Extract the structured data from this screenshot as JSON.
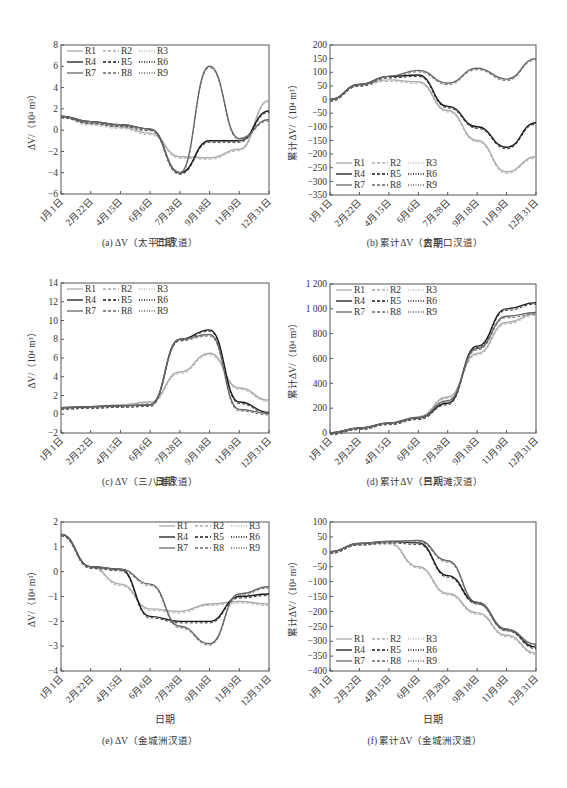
{
  "figure": {
    "x_axis_label": "日期",
    "x_tick_labels": [
      "1月1日",
      "2月22日",
      "4月15日",
      "6月6日",
      "7月28日",
      "9月18日",
      "11月9日",
      "12月31日"
    ],
    "legend": [
      "R1",
      "R2",
      "R3",
      "R4",
      "R5",
      "R6",
      "R7",
      "R8",
      "R9"
    ]
  },
  "chart_data": [
    {
      "id": "a",
      "type": "line",
      "caption": "(a) ΔV（太平口汊道）",
      "title": "",
      "xlabel": "日期",
      "ylabel": "ΔV/（10⁴ m³）",
      "x": [
        "1月1日",
        "2月22日",
        "4月15日",
        "6月6日",
        "7月28日",
        "9月18日",
        "11月9日",
        "12月31日"
      ],
      "ylim": [
        -6,
        8
      ],
      "yticks": [
        -6,
        -4,
        -2,
        0,
        2,
        4,
        6,
        8
      ],
      "grid": false,
      "legend_position": "upper left",
      "series": [
        {
          "name": "R1-R3 (gray)",
          "values": [
            1.3,
            0.6,
            0.3,
            -0.3,
            -2.5,
            -2.6,
            -1.8,
            2.8
          ]
        },
        {
          "name": "R4-R6 (black)",
          "values": [
            1.3,
            0.8,
            0.5,
            0.1,
            -4.0,
            -1.0,
            -1.0,
            1.8
          ]
        },
        {
          "name": "R7-R9 (dark gray)",
          "values": [
            1.3,
            0.8,
            0.5,
            0.1,
            -4.0,
            6.0,
            -0.8,
            1.0
          ]
        }
      ]
    },
    {
      "id": "b",
      "type": "line",
      "caption": "(b) 累计ΔV（太平口汊道）",
      "title": "",
      "xlabel": "日期",
      "ylabel": "累计ΔV/（10⁴ m³）",
      "x": [
        "1月1日",
        "2月22日",
        "4月15日",
        "6月6日",
        "7月28日",
        "9月18日",
        "11月9日",
        "12月31日"
      ],
      "ylim": [
        -350,
        200
      ],
      "yticks": [
        -350,
        -300,
        -250,
        -200,
        -150,
        -100,
        -50,
        0,
        50,
        100,
        150,
        200
      ],
      "grid": false,
      "legend_position": "lower left",
      "series": [
        {
          "name": "R1-R3 (gray)",
          "values": [
            0,
            55,
            72,
            65,
            -40,
            -150,
            -265,
            -210
          ]
        },
        {
          "name": "R4-R6 (black)",
          "values": [
            0,
            55,
            85,
            90,
            -25,
            -100,
            -175,
            -85
          ]
        },
        {
          "name": "R7-R9 (dark gray)",
          "values": [
            0,
            55,
            85,
            107,
            60,
            115,
            75,
            150
          ]
        }
      ]
    },
    {
      "id": "c",
      "type": "line",
      "caption": "(c) ΔV（三八滩汊道）",
      "title": "",
      "xlabel": "日期",
      "ylabel": "ΔV/（10⁴ m³）",
      "x": [
        "1月1日",
        "2月22日",
        "4月15日",
        "6月6日",
        "7月28日",
        "9月18日",
        "11月9日",
        "12月31日"
      ],
      "ylim": [
        -2,
        14
      ],
      "yticks": [
        -2,
        0,
        2,
        4,
        6,
        8,
        10,
        12,
        14
      ],
      "grid": false,
      "legend_position": "upper left",
      "series": [
        {
          "name": "R1-R3 (gray)",
          "values": [
            0.7,
            0.8,
            1.0,
            1.3,
            4.5,
            6.5,
            2.8,
            1.5
          ]
        },
        {
          "name": "R4-R6 (black)",
          "values": [
            0.7,
            0.8,
            0.9,
            1.0,
            8.0,
            9.0,
            1.3,
            0.2
          ]
        },
        {
          "name": "R7-R9 (dark gray)",
          "values": [
            0.7,
            0.8,
            0.9,
            1.0,
            8.0,
            8.5,
            0.5,
            0.1
          ]
        }
      ]
    },
    {
      "id": "d",
      "type": "line",
      "caption": "(d) 累计ΔV（三八滩汊道）",
      "title": "",
      "xlabel": "日期",
      "ylabel": "累计ΔV/（10⁴ m³）",
      "x": [
        "1月1日",
        "2月22日",
        "4月15日",
        "6月6日",
        "7月28日",
        "9月18日",
        "11月9日",
        "12月31日"
      ],
      "ylim": [
        0,
        1200
      ],
      "yticks": [
        0,
        200,
        400,
        600,
        800,
        1000,
        1200
      ],
      "grid": false,
      "legend_position": "upper left",
      "series": [
        {
          "name": "R1-R3 (gray)",
          "values": [
            0,
            40,
            80,
            130,
            290,
            640,
            890,
            960
          ]
        },
        {
          "name": "R4-R6 (black)",
          "values": [
            0,
            40,
            80,
            120,
            240,
            700,
            1000,
            1050
          ]
        },
        {
          "name": "R7-R9 (dark gray)",
          "values": [
            0,
            40,
            80,
            125,
            260,
            680,
            940,
            970
          ]
        }
      ]
    },
    {
      "id": "e",
      "type": "line",
      "caption": "(e) ΔV（金城洲汊道）",
      "title": "",
      "xlabel": "日期",
      "ylabel": "ΔV/（10⁴ m³）",
      "x": [
        "1月1日",
        "2月22日",
        "4月15日",
        "6月6日",
        "7月28日",
        "9月18日",
        "11月9日",
        "12月31日"
      ],
      "ylim": [
        -4,
        2
      ],
      "yticks": [
        -4,
        -3,
        -2,
        -1,
        0,
        1,
        2
      ],
      "grid": false,
      "legend_position": "upper right",
      "series": [
        {
          "name": "R1-R3 (gray)",
          "values": [
            1.5,
            0.2,
            -0.5,
            -1.5,
            -1.6,
            -1.3,
            -1.2,
            -1.3
          ]
        },
        {
          "name": "R4-R6 (black)",
          "values": [
            1.5,
            0.2,
            0.1,
            -1.8,
            -2.0,
            -2.0,
            -1.0,
            -0.9
          ]
        },
        {
          "name": "R7-R9 (dark gray)",
          "values": [
            1.5,
            0.2,
            0.1,
            -0.5,
            -2.2,
            -2.9,
            -0.9,
            -0.6
          ]
        }
      ]
    },
    {
      "id": "f",
      "type": "line",
      "caption": "(f) 累计ΔV（金城洲汊道）",
      "title": "",
      "xlabel": "日期",
      "ylabel": "累计ΔV/（10⁴ m³）",
      "x": [
        "1月1日",
        "2月22日",
        "4月15日",
        "6月6日",
        "7月28日",
        "9月18日",
        "11月9日",
        "12月31日"
      ],
      "ylim": [
        -400,
        100
      ],
      "yticks": [
        -400,
        -350,
        -300,
        -250,
        -200,
        -150,
        -100,
        -50,
        0,
        50,
        100
      ],
      "grid": false,
      "legend_position": "lower left",
      "series": [
        {
          "name": "R1-R3 (gray)",
          "values": [
            0,
            28,
            30,
            -50,
            -140,
            -205,
            -280,
            -340
          ]
        },
        {
          "name": "R4-R6 (black)",
          "values": [
            0,
            28,
            35,
            30,
            -80,
            -170,
            -260,
            -320
          ]
        },
        {
          "name": "R7-R9 (dark gray)",
          "values": [
            0,
            28,
            35,
            38,
            -30,
            -170,
            -260,
            -310
          ]
        }
      ]
    }
  ]
}
